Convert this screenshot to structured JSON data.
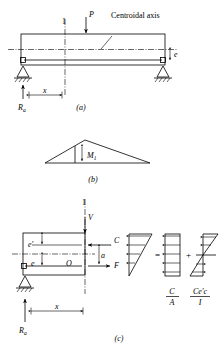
{
  "figure": {
    "panels": [
      {
        "id": "a",
        "label": "(a)",
        "caption": "Beam elevation with centroidal axis, load P and eccentricity e"
      },
      {
        "id": "b",
        "label": "(b)",
        "caption": "Bending moment diagram, triangular"
      },
      {
        "id": "c",
        "label": "(c)",
        "caption": "Free body of left segment and stress distribution decomposition"
      }
    ]
  },
  "panel_a": {
    "panel_label": "(a)",
    "load_label": "P",
    "section_marker": "1",
    "centroidal_axis_label": "Centroidal axis",
    "eccentricity_label": "e",
    "distance_label": "x",
    "reaction_label": "R",
    "reaction_sub": "a"
  },
  "panel_b": {
    "panel_label": "(b)",
    "moment_label": "M",
    "moment_sub": "1"
  },
  "panel_c": {
    "panel_label": "(c)",
    "section_marker": "1",
    "shear_label": "V",
    "compression_label": "C",
    "force_label": "F",
    "lever_arm_label": "a",
    "origin_label": "O",
    "e_prime_label": "e'",
    "e_label": "e",
    "distance_label": "x",
    "reaction_label": "R",
    "reaction_sub": "a",
    "equals_sign": "=",
    "plus_sign": "+",
    "term1_numerator": "C",
    "term1_denominator": "A",
    "term2_numerator": "Ce'c",
    "term2_denominator": "I"
  },
  "colors": {
    "line": "#000000",
    "background": "#ffffff"
  }
}
